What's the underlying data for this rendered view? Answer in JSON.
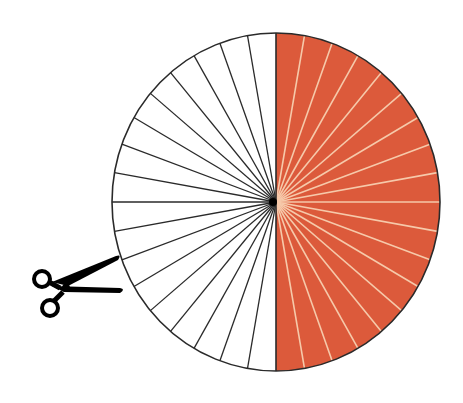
{
  "diagram": {
    "circle": {
      "cx": 276,
      "cy": 202,
      "rx": 164,
      "ry": 169
    },
    "sector_count": 36,
    "shaded_sectors": 18,
    "unshaded_sectors": 18,
    "colors": {
      "shaded_fill": "#DC5A3B",
      "shaded_divider": "#F6C9AA",
      "unshaded_fill": "#FFFFFF",
      "unshaded_divider": "#2a2a2a",
      "outline": "#2a2a2a",
      "scissors": "#000000"
    }
  },
  "icons": {
    "scissors": "scissors-icon"
  }
}
